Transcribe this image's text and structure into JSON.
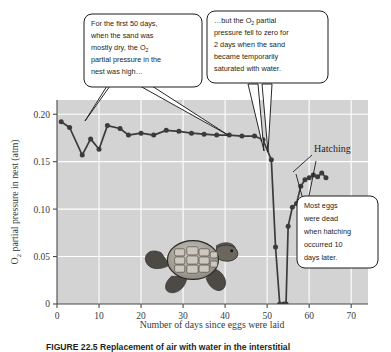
{
  "figure": {
    "caption_label": "FIGURE 22.5",
    "caption_text": "Replacement of air with water in the interstitial"
  },
  "chart_data": {
    "type": "line",
    "title": "",
    "xlabel": "Number of days since eggs were laid",
    "ylabel": "O₂ partial pressure in nest (atm)",
    "xlim": [
      0,
      74
    ],
    "ylim": [
      0,
      0.215
    ],
    "xticks": [
      0,
      10,
      20,
      30,
      40,
      50,
      60,
      70
    ],
    "xtick_labels": [
      "0",
      "10",
      "20",
      "30",
      "40",
      "50",
      "60",
      "70"
    ],
    "yticks": [
      0,
      0.05,
      0.1,
      0.15,
      0.2
    ],
    "ytick_labels": [
      "0",
      "0.05",
      "0.10",
      "0.15",
      "0.20"
    ],
    "grid": true,
    "grid_color": "#ffffff",
    "plot_bg": "#d3d3d3",
    "line_color": "#3b3b3b",
    "marker_color": "#3b3b3b",
    "series": [
      {
        "name": "O2 partial pressure in nest",
        "x": [
          1,
          3,
          6,
          8,
          10,
          12,
          15,
          17,
          20,
          23,
          26,
          29,
          32,
          35,
          38,
          41,
          44,
          47,
          49,
          51,
          52,
          53,
          54,
          54.5,
          55,
          56,
          57,
          58,
          59,
          60,
          61,
          62,
          63,
          64
        ],
        "y": [
          0.192,
          0.186,
          0.157,
          0.174,
          0.163,
          0.188,
          0.185,
          0.178,
          0.18,
          0.178,
          0.183,
          0.182,
          0.18,
          0.179,
          0.178,
          0.178,
          0.177,
          0.177,
          0.173,
          0.152,
          0.06,
          0.0,
          0.0,
          0.0,
          0.082,
          0.102,
          0.106,
          0.124,
          0.131,
          0.133,
          0.136,
          0.134,
          0.138,
          0.133
        ]
      }
    ],
    "annotations": [
      {
        "name": "hatching-label",
        "text": "Hatching",
        "x": 0.845,
        "y": 0.425
      }
    ]
  },
  "callouts": [
    {
      "name": "callout-early-days",
      "lines": [
        "For the first 50 days,",
        "when the sand was",
        "mostly dry, the O₂",
        "partial pressure in the",
        "nest was high…"
      ]
    },
    {
      "name": "callout-pressure-zero",
      "lines": [
        "…but the O₂ partial",
        "pressure fell to zero for",
        "2 days when the sand",
        "became temporarily",
        "saturated with water."
      ]
    },
    {
      "name": "callout-eggs-dead",
      "lines": [
        "Most eggs",
        "were dead",
        "when hatching",
        "occurred 10",
        "days later."
      ]
    }
  ],
  "icons": {
    "turtle": "sea-turtle-hatchling-illustration"
  }
}
